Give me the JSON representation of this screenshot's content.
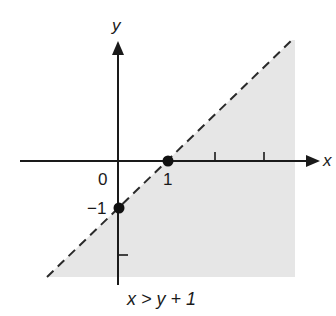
{
  "diagram": {
    "type": "inequality-graph",
    "inequality": "x > y + 1",
    "boundary_line": "y = x - 1",
    "boundary_style": "dashed",
    "shaded_region": "below-right of boundary line",
    "colors": {
      "shading": "#e6e6e6",
      "ink": "#1a1a1a",
      "background": "#ffffff"
    },
    "axes": {
      "x_label": "x",
      "y_label": "y",
      "origin_label": "0"
    },
    "tick_labels": {
      "x_one": "1",
      "y_minus_one": "−1"
    },
    "points": [
      {
        "label": "(1, 0)",
        "x": 1,
        "y": 0
      },
      {
        "label": "(0, -1)",
        "x": 0,
        "y": -1
      }
    ],
    "x_ticks": [
      1,
      2,
      3
    ],
    "y_ticks": [
      -1,
      -2
    ],
    "caption": "x > y + 1"
  }
}
